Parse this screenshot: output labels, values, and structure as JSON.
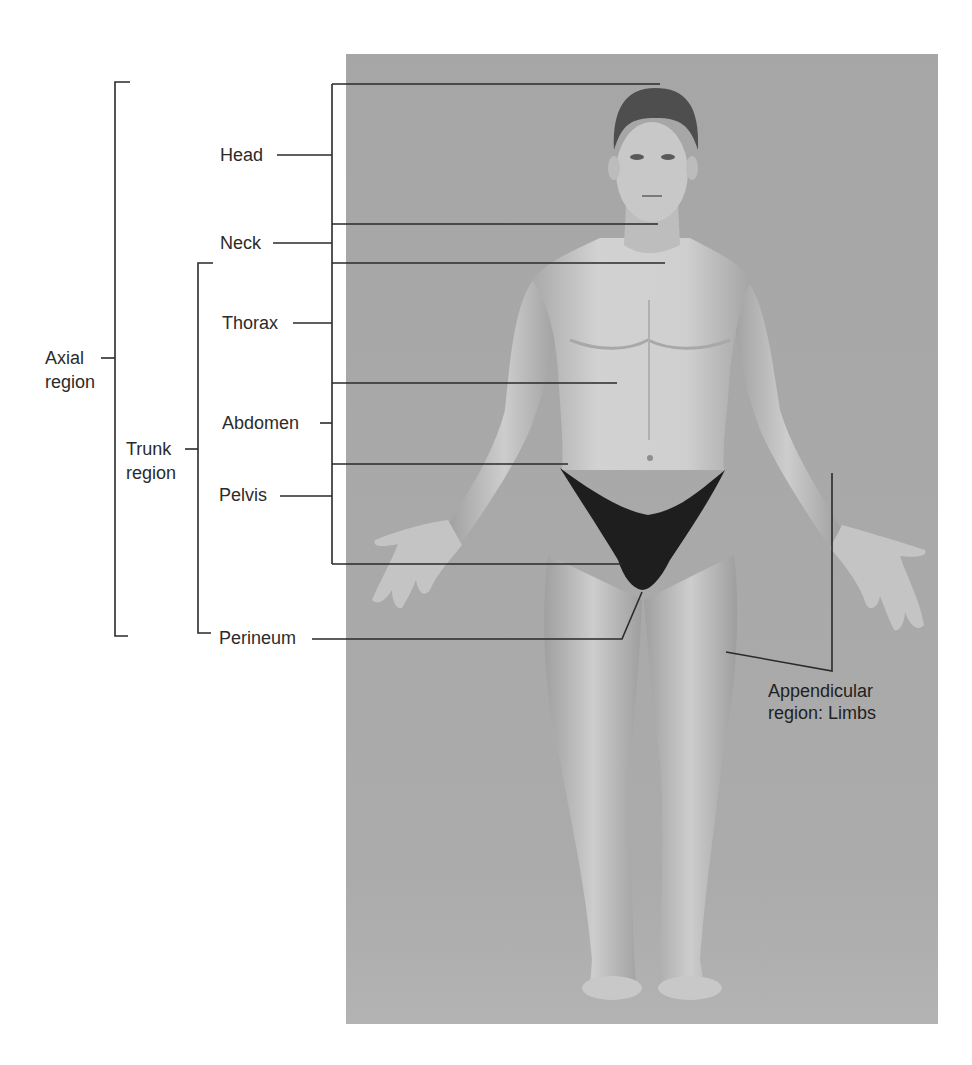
{
  "figure": {
    "photo": {
      "background_color": "#a8a8a8",
      "subject": "Anterior view of standing male figure, arms abducted, palms forward"
    },
    "brackets": {
      "axial": {
        "line1": "Axial",
        "line2": "region"
      },
      "trunk": {
        "line1": "Trunk",
        "line2": "region"
      }
    },
    "regions": [
      {
        "id": "head",
        "label": "Head"
      },
      {
        "id": "neck",
        "label": "Neck"
      },
      {
        "id": "thorax",
        "label": "Thorax"
      },
      {
        "id": "abdomen",
        "label": "Abdomen"
      },
      {
        "id": "pelvis",
        "label": "Pelvis"
      },
      {
        "id": "perineum",
        "label": "Perineum"
      }
    ],
    "appendicular": {
      "line1": "Appendicular",
      "line2": "region: Limbs"
    },
    "colors": {
      "line": "#2a2a2a",
      "text": "#2b2b2b",
      "photo_bg": "#a8a8a8",
      "skin": "#c9c9c9",
      "skin_shadow": "#9a9a9a",
      "hair": "#4a4a4a",
      "garment": "#1c1c1c"
    }
  }
}
